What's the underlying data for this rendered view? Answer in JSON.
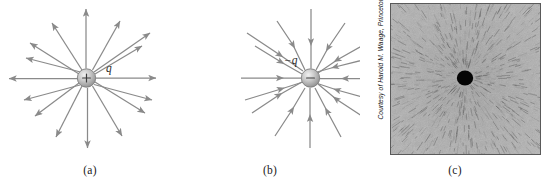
{
  "figure": {
    "name": "electric-field-lines-point-charge",
    "panels": [
      {
        "id": "a",
        "caption": "(a)",
        "charge_sign": "+",
        "charge_label": "q",
        "field_direction": "outward",
        "num_field_lines": 16,
        "line_color": "#8a8a8a",
        "charge_fill": "#b9b9b9",
        "description": "Electric field lines point radially outward from a positive point charge q."
      },
      {
        "id": "b",
        "caption": "(b)",
        "charge_sign": "−",
        "charge_label": "−q",
        "field_direction": "inward",
        "num_field_lines": 16,
        "line_color": "#8a8a8a",
        "charge_fill": "#b9b9b9",
        "description": "Electric field lines point radially inward toward a negative point charge −q."
      },
      {
        "id": "c",
        "caption": "(c)",
        "credit": "Courtesy of Harold M. Waage, Princeton University",
        "photo_description": "Photograph of grass seeds in oil aligning radially around a charged conductor.",
        "frame_color": "#5a5a5a",
        "dot_color": "#000000"
      }
    ]
  }
}
